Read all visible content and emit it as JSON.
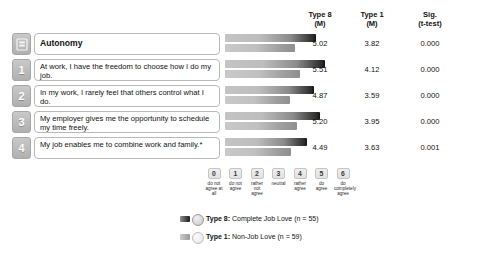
{
  "table": {
    "headers": [
      {
        "id": "type8",
        "line1": "Type 8",
        "line2": "(M)"
      },
      {
        "id": "type1",
        "line1": "Type 1",
        "line2": "(M)"
      },
      {
        "id": "sig",
        "line1": "Sig.",
        "line2": "(t-test)"
      }
    ]
  },
  "rows": [
    {
      "badge": "",
      "badge_icon": "construct-icon",
      "is_construct": true,
      "label": "Autonomy",
      "type8_m": "5.02",
      "type1_m": "3.82",
      "sig": "0.000"
    },
    {
      "badge": "1",
      "badge_icon": "",
      "is_construct": false,
      "label": "At work, I have the freedom to choose how I do my job.",
      "type8_m": "5.51",
      "type1_m": "4.12",
      "sig": "0.000"
    },
    {
      "badge": "2",
      "badge_icon": "",
      "is_construct": false,
      "label": "In my work, I rarely feel that others control what I do.",
      "type8_m": "4.87",
      "type1_m": "3.59",
      "sig": "0.000"
    },
    {
      "badge": "3",
      "badge_icon": "",
      "is_construct": false,
      "label": "My employer gives me the opportunity to schedule my time freely.",
      "type8_m": "5.20",
      "type1_m": "3.95",
      "sig": "0.000"
    },
    {
      "badge": "4",
      "badge_icon": "",
      "is_construct": false,
      "label": "My job enables me to combine work and family.*",
      "type8_m": "4.49",
      "type1_m": "3.63",
      "sig": "0.001"
    }
  ],
  "scale": {
    "items": [
      {
        "value": "0",
        "caption": "do not agree at all"
      },
      {
        "value": "1",
        "caption": "do not agree"
      },
      {
        "value": "2",
        "caption": "rather not agree"
      },
      {
        "value": "3",
        "caption": "neutral"
      },
      {
        "value": "4",
        "caption": "rather agree"
      },
      {
        "value": "5",
        "caption": "do agree"
      },
      {
        "value": "6",
        "caption": "do completely agree"
      }
    ]
  },
  "legend": {
    "entries": [
      {
        "series": "Type 8",
        "text": "Type 8: Complete Job Love (n = 55)",
        "n": 55,
        "swatch": "t8"
      },
      {
        "series": "Type 1",
        "text": "Type 1: Non-Job Love (n = 59)",
        "n": 59,
        "swatch": "t1"
      }
    ]
  },
  "colors": {
    "type8_bar_dark": "#111111",
    "type8_bar_light": "#c4c4c4",
    "type1_bar_dark": "#8f8f8f",
    "type1_bar_light": "#c9c9c9",
    "badge": "#bdbdbd",
    "background": "#ffffff",
    "text": "#111111"
  },
  "chart_data": {
    "type": "bar",
    "title": "Autonomy",
    "xlabel": "",
    "ylabel": "",
    "orientation": "horizontal",
    "xlim": [
      0,
      6
    ],
    "grid": false,
    "legend_position": "bottom",
    "categories": [
      "Autonomy",
      "At work, I have the freedom to choose how I do my job.",
      "In my work, I rarely feel that others control what I do.",
      "My employer gives me the opportunity to schedule my time freely.",
      "My job enables me to combine work and family.*"
    ],
    "series": [
      {
        "name": "Type 8: Complete Job Love (n = 55)",
        "values": [
          5.02,
          5.51,
          4.87,
          5.2,
          4.49
        ]
      },
      {
        "name": "Type 1: Non-Job Love (n = 59)",
        "values": [
          3.82,
          4.12,
          3.59,
          3.95,
          3.63
        ]
      }
    ],
    "annotations": {
      "sig_t_test": [
        "0.000",
        "0.000",
        "0.000",
        "0.000",
        "0.001"
      ]
    },
    "tick_labels": [
      "0",
      "1",
      "2",
      "3",
      "4",
      "5",
      "6"
    ],
    "tick_captions": [
      "do not agree at all",
      "do not agree",
      "rather not agree",
      "neutral",
      "rather agree",
      "do agree",
      "do completely agree"
    ]
  }
}
